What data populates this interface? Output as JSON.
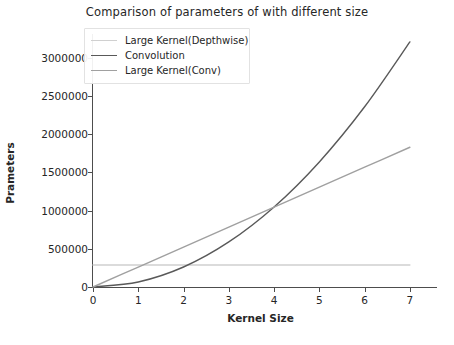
{
  "chart_data": {
    "type": "line",
    "title": "Comparison of parameters of with different size",
    "xlabel": "Kernel Size",
    "ylabel": "Prameters",
    "xlim": [
      0,
      7.4
    ],
    "ylim": [
      0,
      3300000
    ],
    "grid": false,
    "legend_position": "upper left",
    "x": [
      0,
      1,
      2,
      3,
      4,
      5,
      6,
      7
    ],
    "xticks": [
      "0",
      "1",
      "2",
      "3",
      "4",
      "5",
      "6",
      "7"
    ],
    "yticks": [
      "0",
      "500000",
      "1000000",
      "1500000",
      "2000000",
      "2500000",
      "3000000"
    ],
    "ytick_values": [
      0,
      500000,
      1000000,
      1500000,
      2000000,
      2500000,
      3000000
    ],
    "series": [
      {
        "name": "Large Kernel(Depthwise)",
        "color": "#d0d0d0",
        "width": 1.4,
        "values": [
          288000,
          288000,
          288000,
          288000,
          288000,
          288000,
          288000,
          288000
        ]
      },
      {
        "name": "Convolution",
        "color": "#595959",
        "width": 1.4,
        "values": [
          0,
          66000,
          262000,
          590000,
          1048000,
          1638000,
          2360000,
          3210000
        ]
      },
      {
        "name": "Large Kernel(Conv)",
        "color": "#a0a0a0",
        "width": 1.4,
        "values": [
          0,
          261000,
          523000,
          784000,
          1046000,
          1307000,
          1569000,
          1830000
        ]
      }
    ]
  }
}
